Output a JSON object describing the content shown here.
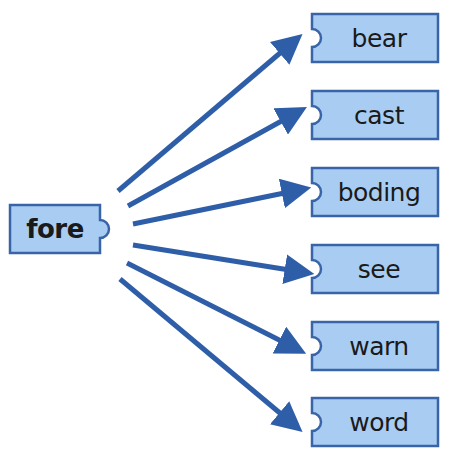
{
  "colors": {
    "box_fill": "#a9cdf2",
    "box_stroke": "#3a64a8",
    "arrow": "#2f5ea8",
    "text": "#1a1a1a"
  },
  "root": {
    "label": "fore",
    "x": 10,
    "y": 205,
    "w": 90,
    "h": 48
  },
  "targets": [
    {
      "label": "bear",
      "x": 312,
      "y": 14,
      "w": 126,
      "h": 48
    },
    {
      "label": "cast",
      "x": 312,
      "y": 91,
      "w": 126,
      "h": 48
    },
    {
      "label": "boding",
      "x": 312,
      "y": 168,
      "w": 126,
      "h": 48
    },
    {
      "label": "see",
      "x": 312,
      "y": 245,
      "w": 126,
      "h": 48
    },
    {
      "label": "warn",
      "x": 312,
      "y": 322,
      "w": 126,
      "h": 48
    },
    {
      "label": "word",
      "x": 312,
      "y": 398,
      "w": 126,
      "h": 48
    }
  ],
  "arrows": [
    {
      "x1": 118,
      "y1": 191,
      "x2": 293,
      "y2": 42
    },
    {
      "x1": 128,
      "y1": 206,
      "x2": 296,
      "y2": 113
    },
    {
      "x1": 133,
      "y1": 224,
      "x2": 299,
      "y2": 190
    },
    {
      "x1": 133,
      "y1": 245,
      "x2": 302,
      "y2": 272
    },
    {
      "x1": 127,
      "y1": 263,
      "x2": 295,
      "y2": 348
    },
    {
      "x1": 120,
      "y1": 279,
      "x2": 293,
      "y2": 424
    }
  ]
}
